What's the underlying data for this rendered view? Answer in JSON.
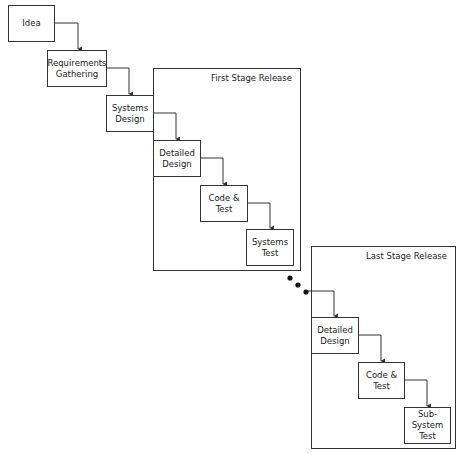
{
  "stages": [
    {
      "id": "first",
      "label": "First Stage Release"
    },
    {
      "id": "last",
      "label": "Last Stage Release"
    }
  ],
  "nodes": [
    {
      "id": "idea",
      "label": "Idea"
    },
    {
      "id": "requirements",
      "label": "Requirements\nGathering"
    },
    {
      "id": "systems-design",
      "label": "Systems\nDesign"
    },
    {
      "id": "detailed-design-1",
      "label": "Detailed\nDesign"
    },
    {
      "id": "code-test-1",
      "label": "Code &\nTest"
    },
    {
      "id": "systems-test",
      "label": "Systems\nTest"
    },
    {
      "id": "detailed-design-2",
      "label": "Detailed\nDesign"
    },
    {
      "id": "code-test-2",
      "label": "Code &\nTest"
    },
    {
      "id": "sub-system-test",
      "label": "Sub-System\nTest"
    }
  ],
  "continuation": {
    "symbol": "ellipsis-dots",
    "count": 3
  },
  "colors": {
    "stroke": "#333333",
    "text": "#222222",
    "background": "#ffffff"
  }
}
